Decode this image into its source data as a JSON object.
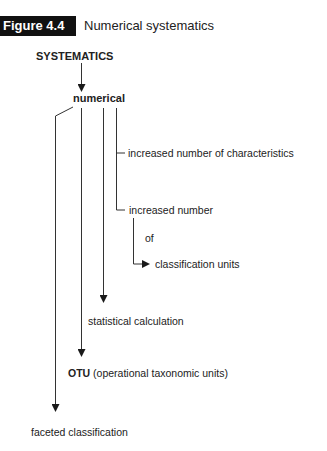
{
  "figure": {
    "label": "Figure 4.4",
    "title": "Numerical systematics"
  },
  "diagram": {
    "root": "SYSTEMATICS",
    "node": "numerical",
    "branches": {
      "characteristics": "increased number of characteristics",
      "increased_number": "increased number",
      "of": "of",
      "classification_units": "classification units",
      "statistical": "statistical calculation",
      "otu_bold": "OTU",
      "otu_rest": "(operational taxonomic units)",
      "faceted": "faceted classification"
    }
  }
}
